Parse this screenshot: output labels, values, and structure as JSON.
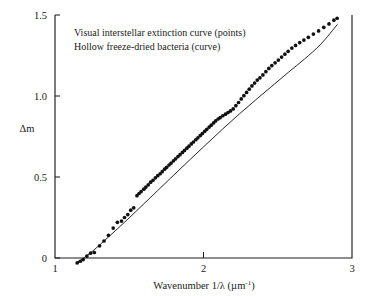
{
  "chart_data": {
    "type": "scatter",
    "title": "",
    "xlabel": "Wavenumber 1/λ (µm⁻¹)",
    "xlabel_main": "Wavenumber 1/λ (µm",
    "xlabel_sup": "-1",
    "xlabel_tail": ")",
    "ylabel": "Δm",
    "xlim": [
      1,
      3
    ],
    "ylim": [
      0,
      1.5
    ],
    "xticks": [
      1,
      2,
      3
    ],
    "xtick_labels": [
      "1",
      "2",
      "3"
    ],
    "yticks": [
      0,
      0.5,
      1.0,
      1.5
    ],
    "ytick_labels": [
      "0",
      "0.5",
      "1.0",
      "1.5"
    ],
    "grid": false,
    "legend_position": "inside-top-left",
    "annotations": [
      "Visual interstellar extinction curve (points)",
      "Hollow freeze-dried bacteria (curve)"
    ],
    "series": [
      {
        "name": "Visual interstellar extinction curve",
        "type": "scatter",
        "marker": "filled-circle",
        "color": "#111111",
        "x": [
          1.15,
          1.17,
          1.19,
          1.215,
          1.24,
          1.265,
          1.3,
          1.33,
          1.36,
          1.392,
          1.42,
          1.448,
          1.468,
          1.49,
          1.51,
          1.53,
          1.552,
          1.566,
          1.58,
          1.598,
          1.612,
          1.628,
          1.644,
          1.66,
          1.676,
          1.692,
          1.708,
          1.722,
          1.738,
          1.752,
          1.768,
          1.782,
          1.798,
          1.812,
          1.828,
          1.842,
          1.858,
          1.872,
          1.888,
          1.902,
          1.918,
          1.932,
          1.948,
          1.962,
          1.978,
          1.992,
          2.008,
          2.022,
          2.038,
          2.052,
          2.068,
          2.082,
          2.098,
          2.112,
          2.13,
          2.148,
          2.165,
          2.182,
          2.2,
          2.218,
          2.236,
          2.254,
          2.272,
          2.29,
          2.308,
          2.326,
          2.344,
          2.362,
          2.38,
          2.4,
          2.42,
          2.44,
          2.46,
          2.482,
          2.504,
          2.526,
          2.548,
          2.57,
          2.595,
          2.62,
          2.648,
          2.676,
          2.706,
          2.74,
          2.775,
          2.81,
          2.845,
          2.878,
          2.9
        ],
        "y": [
          -0.03,
          -0.02,
          -0.01,
          0.012,
          0.03,
          0.034,
          0.075,
          0.105,
          0.14,
          0.185,
          0.22,
          0.228,
          0.25,
          0.268,
          0.295,
          0.31,
          0.385,
          0.398,
          0.41,
          0.425,
          0.438,
          0.452,
          0.468,
          0.48,
          0.495,
          0.508,
          0.52,
          0.533,
          0.548,
          0.56,
          0.574,
          0.586,
          0.6,
          0.612,
          0.626,
          0.638,
          0.652,
          0.664,
          0.678,
          0.69,
          0.704,
          0.716,
          0.73,
          0.742,
          0.756,
          0.768,
          0.782,
          0.794,
          0.808,
          0.82,
          0.834,
          0.846,
          0.858,
          0.866,
          0.878,
          0.888,
          0.898,
          0.908,
          0.92,
          0.94,
          0.96,
          0.982,
          1.002,
          1.022,
          1.042,
          1.062,
          1.08,
          1.098,
          1.112,
          1.13,
          1.15,
          1.17,
          1.188,
          1.205,
          1.222,
          1.24,
          1.258,
          1.276,
          1.296,
          1.312,
          1.33,
          1.345,
          1.362,
          1.382,
          1.402,
          1.424,
          1.445,
          1.468,
          1.48
        ]
      },
      {
        "name": "Hollow freeze-dried bacteria",
        "type": "line",
        "color": "#1c1c1c",
        "x": [
          1.14,
          1.25,
          1.36,
          1.47,
          1.58,
          1.69,
          1.8,
          1.91,
          2.02,
          2.13,
          2.24,
          2.35,
          2.46,
          2.57,
          2.68,
          2.79,
          2.9
        ],
        "y": [
          -0.035,
          0.04,
          0.13,
          0.222,
          0.318,
          0.415,
          0.512,
          0.608,
          0.703,
          0.797,
          0.888,
          0.975,
          1.06,
          1.145,
          1.228,
          1.32,
          1.44
        ]
      }
    ]
  }
}
